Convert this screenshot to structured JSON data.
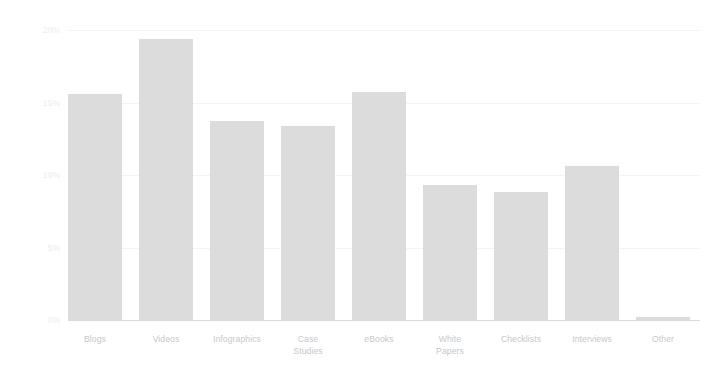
{
  "chart_data": {
    "type": "bar",
    "title": "",
    "subtitle": "",
    "xlabel": "",
    "ylabel": "",
    "ylim": [
      0,
      20
    ],
    "grid": true,
    "legend": false,
    "legend_position": "none",
    "bar_color": "#dcdcdc",
    "axis_color": "#d6dade",
    "gridline_color": "#f2f4f6",
    "tick_label_color": "#eaeef2",
    "category_label_color": "#c3c8cd",
    "y_ticks": [
      {
        "value": 20,
        "label": "20%"
      },
      {
        "value": 15,
        "label": "15%"
      },
      {
        "value": 10,
        "label": "10%"
      },
      {
        "value": 5,
        "label": "5%"
      },
      {
        "value": 0,
        "label": "0%"
      }
    ],
    "categories": [
      "Blogs",
      "Videos",
      "Infographics",
      "Case Studies",
      "eBooks",
      "White Papers",
      "Checklists",
      "Interviews",
      "Other"
    ],
    "category_lines": [
      [
        "Blogs"
      ],
      [
        "Videos"
      ],
      [
        "Infographics"
      ],
      [
        "Case",
        "Studies"
      ],
      [
        "eBooks"
      ],
      [
        "White",
        "Papers"
      ],
      [
        "Checklists"
      ],
      [
        "Interviews"
      ],
      [
        "Other"
      ]
    ],
    "values": [
      15.6,
      19.4,
      13.7,
      13.4,
      15.7,
      9.3,
      8.8,
      10.6,
      0.2
    ],
    "value_labels": [
      "15.6%",
      "19.4%",
      "13.7%",
      "13.4%",
      "15.7%",
      "9.3%",
      "8.8%",
      "10.6%",
      "0.2%"
    ]
  }
}
